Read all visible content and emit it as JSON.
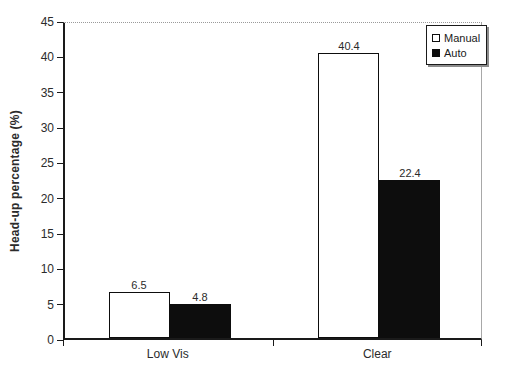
{
  "chart_data": {
    "type": "bar",
    "title": "",
    "categories": [
      "Low Vis",
      "Clear"
    ],
    "series": [
      {
        "name": "Manual",
        "values": [
          6.5,
          40.4
        ],
        "labels": [
          "6.5",
          "40.4"
        ],
        "fill": "#ffffff"
      },
      {
        "name": "Auto",
        "values": [
          4.8,
          22.4
        ],
        "labels": [
          "4.8",
          "22.4"
        ],
        "fill": "#0d0d0d"
      }
    ],
    "xlabel": "",
    "ylabel": "Head-up percentage (%)",
    "ylim": [
      0,
      45
    ],
    "ytick_step": 5,
    "ytick_labels": [
      "0",
      "5",
      "10",
      "15",
      "20",
      "25",
      "30",
      "35",
      "40",
      "45"
    ],
    "legend": {
      "position": "top-right",
      "entries": [
        "Manual",
        "Auto"
      ]
    },
    "grid": "dotted top gridline at y=45 only"
  },
  "colors": {
    "background": "#ffffff",
    "axis": "#1a1a1a",
    "text": "#2b2b2b",
    "manual_fill": "#ffffff",
    "auto_fill": "#0d0d0d",
    "bar_border": "#0d0d0d",
    "plot_right_border": "#a8a8a8",
    "top_gridline": "#9a9a9a",
    "legend_shadow": "#8c8c8c"
  }
}
